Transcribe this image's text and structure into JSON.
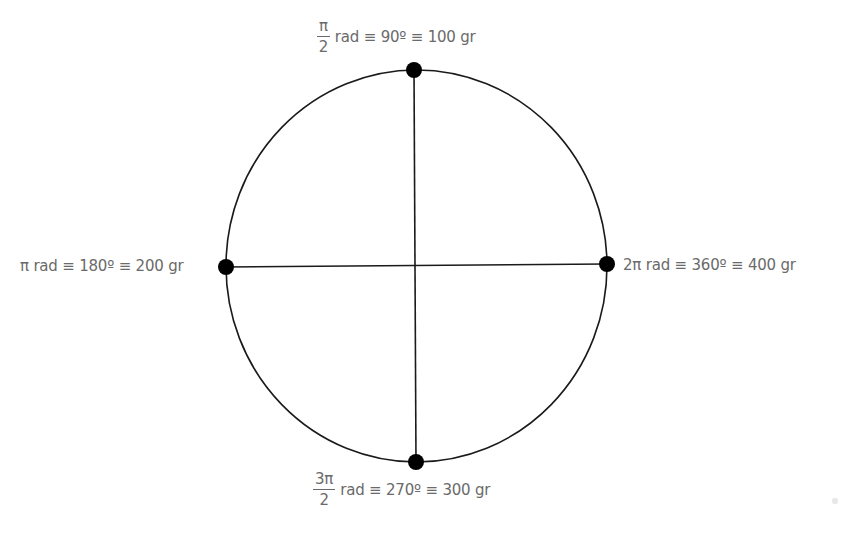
{
  "diagram": {
    "colors": {
      "stroke": "#1a1a1a",
      "point": "#000000",
      "label": "#6a6a6a",
      "background": "#ffffff"
    },
    "circle": {
      "center": [
        416,
        266
      ],
      "radius": 192
    },
    "points": [
      {
        "id": "top",
        "position": "top",
        "coords": [
          414,
          70
        ],
        "fraction": {
          "numerator": "π",
          "denominator": "2"
        },
        "label_rest": "rad ≡ 90º ≡ 100 gr",
        "label_full": "π/2 rad ≡ 90º ≡ 100 gr"
      },
      {
        "id": "left",
        "position": "left",
        "coords": [
          226,
          267
        ],
        "label_full": "π rad ≡ 180º ≡ 200 gr"
      },
      {
        "id": "right",
        "position": "right",
        "coords": [
          607,
          264
        ],
        "label_full": "2π rad ≡ 360º ≡ 400 gr"
      },
      {
        "id": "bottom",
        "position": "bottom",
        "coords": [
          416,
          462
        ],
        "fraction": {
          "numerator": "3π",
          "denominator": "2"
        },
        "label_rest": "rad ≡ 270º ≡ 300 gr",
        "label_full": "3π/2 rad ≡ 270º ≡ 300 gr"
      }
    ],
    "lines": [
      {
        "name": "vertical-diameter",
        "from": [
          414,
          70
        ],
        "to": [
          416,
          462
        ]
      },
      {
        "name": "horizontal-diameter",
        "from": [
          226,
          267
        ],
        "to": [
          607,
          264
        ]
      }
    ]
  }
}
